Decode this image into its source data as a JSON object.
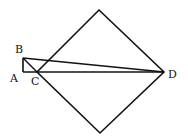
{
  "diagram": {
    "labels": {
      "A": "A",
      "B": "B",
      "C": "C",
      "D": "D"
    },
    "stroke_color": "#111111",
    "background": "#ffffff"
  }
}
